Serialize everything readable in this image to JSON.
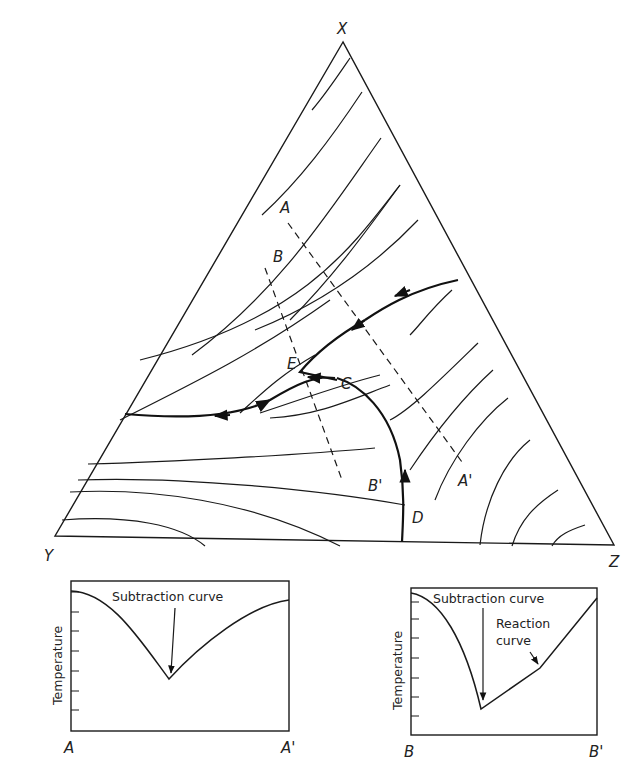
{
  "diagram": {
    "type": "ternary liquidus projection",
    "vertices": {
      "top": "X",
      "left": "Y",
      "right": "Z"
    },
    "points": {
      "C": "C",
      "D": "D",
      "E": "E"
    },
    "sections": {
      "A": "A",
      "A_prime": "A'",
      "B": "B",
      "B_prime": "B'"
    }
  },
  "plot_a": {
    "y_axis_label": "Temperature",
    "x_start_label": "A",
    "x_end_label": "A'",
    "annotation": "Subtraction curve"
  },
  "plot_b": {
    "y_axis_label": "Temperature",
    "x_start_label": "B",
    "x_end_label": "B'",
    "annotation_subtraction": "Subtraction curve",
    "annotation_reaction_line1": "Reaction",
    "annotation_reaction_line2": "curve"
  }
}
